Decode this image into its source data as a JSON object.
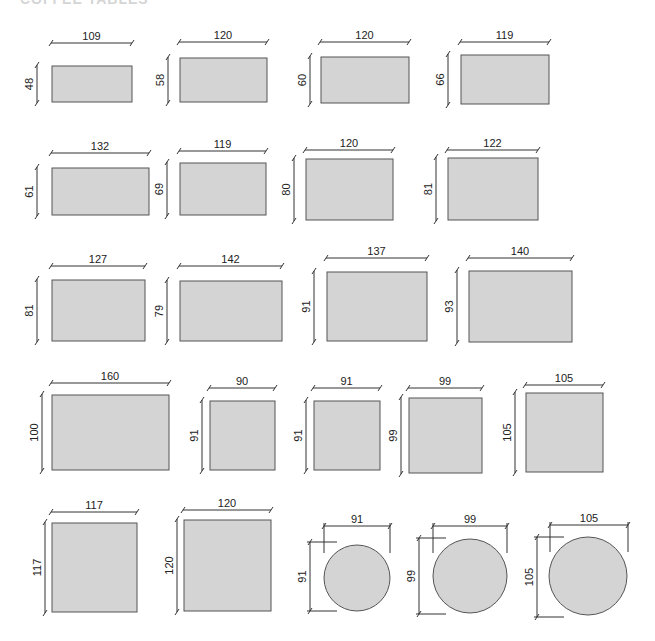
{
  "title": "COFFEE TABLES",
  "colors": {
    "fill": "#d4d4d4",
    "stroke": "#555555",
    "dim": "#333333",
    "text": "#222222"
  },
  "tables": [
    {
      "shape": "rect",
      "w": 109,
      "h": 48,
      "x": 52,
      "y": 66,
      "pw": 80,
      "ph": 36,
      "dimY": 43,
      "sideX": 37
    },
    {
      "shape": "rect",
      "w": 120,
      "h": 58,
      "x": 180,
      "y": 58,
      "pw": 87,
      "ph": 44,
      "dimY": 42,
      "sideX": 168
    },
    {
      "shape": "rect",
      "w": 120,
      "h": 60,
      "x": 321,
      "y": 57,
      "pw": 88,
      "ph": 46,
      "dimY": 42,
      "sideX": 310
    },
    {
      "shape": "rect",
      "w": 119,
      "h": 66,
      "x": 461,
      "y": 55,
      "pw": 88,
      "ph": 49,
      "dimY": 42,
      "sideX": 448
    },
    {
      "shape": "rect",
      "w": 132,
      "h": 61,
      "x": 52,
      "y": 168,
      "pw": 97,
      "ph": 47,
      "dimY": 153,
      "sideX": 37
    },
    {
      "shape": "rect",
      "w": 119,
      "h": 69,
      "x": 180,
      "y": 163,
      "pw": 86,
      "ph": 52,
      "dimY": 151,
      "sideX": 167
    },
    {
      "shape": "rect",
      "w": 120,
      "h": 80,
      "x": 306,
      "y": 159,
      "pw": 87,
      "ph": 61,
      "dimY": 150,
      "sideX": 294
    },
    {
      "shape": "rect",
      "w": 122,
      "h": 81,
      "x": 448,
      "y": 158,
      "pw": 90,
      "ph": 62,
      "dimY": 150,
      "sideX": 436
    },
    {
      "shape": "rect",
      "w": 127,
      "h": 81,
      "x": 52,
      "y": 280,
      "pw": 93,
      "ph": 61,
      "dimY": 266,
      "sideX": 37
    },
    {
      "shape": "rect",
      "w": 142,
      "h": 79,
      "x": 180,
      "y": 281,
      "pw": 102,
      "ph": 60,
      "dimY": 266,
      "sideX": 167
    },
    {
      "shape": "rect",
      "w": 137,
      "h": 91,
      "x": 327,
      "y": 272,
      "pw": 100,
      "ph": 69,
      "dimY": 258,
      "sideX": 314
    },
    {
      "shape": "rect",
      "w": 140,
      "h": 93,
      "x": 469,
      "y": 271,
      "pw": 103,
      "ph": 71,
      "dimY": 258,
      "sideX": 457
    },
    {
      "shape": "rect",
      "w": 160,
      "h": 100,
      "x": 52,
      "y": 395,
      "pw": 117,
      "ph": 75,
      "dimY": 383,
      "sideX": 42
    },
    {
      "shape": "rect",
      "w": 90,
      "h": 91,
      "x": 210,
      "y": 401,
      "pw": 65,
      "ph": 69,
      "dimY": 388,
      "sideX": 202
    },
    {
      "shape": "rect",
      "w": 91,
      "h": 91,
      "x": 314,
      "y": 401,
      "pw": 66,
      "ph": 69,
      "dimY": 388,
      "sideX": 306
    },
    {
      "shape": "rect",
      "w": 99,
      "h": 99,
      "x": 409,
      "y": 398,
      "pw": 73,
      "ph": 75,
      "dimY": 388,
      "sideX": 401
    },
    {
      "shape": "rect",
      "w": 105,
      "h": 105,
      "x": 526,
      "y": 393,
      "pw": 77,
      "ph": 79,
      "dimY": 385,
      "sideX": 515
    },
    {
      "shape": "rect",
      "w": 117,
      "h": 117,
      "x": 52,
      "y": 523,
      "pw": 85,
      "ph": 89,
      "dimY": 512,
      "sideX": 45
    },
    {
      "shape": "rect",
      "w": 120,
      "h": 120,
      "x": 184,
      "y": 520,
      "pw": 87,
      "ph": 91,
      "dimY": 510,
      "sideX": 177
    },
    {
      "shape": "circle",
      "w": 91,
      "h": 91,
      "cx": 357,
      "cy": 578,
      "r": 33,
      "dimY": 526,
      "dimX1": 324,
      "dimX2": 390,
      "sideX": 310,
      "sideY1": 542,
      "sideY2": 611
    },
    {
      "shape": "circle",
      "w": 99,
      "h": 99,
      "cx": 470,
      "cy": 576,
      "r": 37,
      "dimY": 526,
      "dimX1": 433,
      "dimX2": 507,
      "sideX": 419,
      "sideY1": 538,
      "sideY2": 614
    },
    {
      "shape": "circle",
      "w": 105,
      "h": 105,
      "cx": 588,
      "cy": 576,
      "r": 39,
      "dimY": 525,
      "dimX1": 550,
      "dimX2": 628,
      "sideX": 537,
      "sideY1": 537,
      "sideY2": 617
    }
  ]
}
